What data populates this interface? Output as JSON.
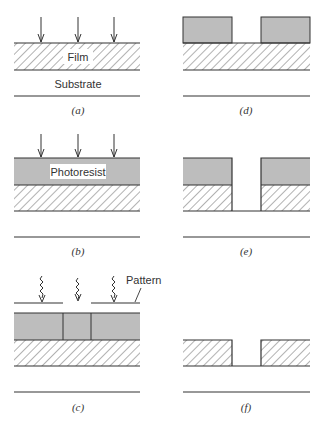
{
  "figure": {
    "colors": {
      "line": "#333333",
      "photoresist_fill": "#bdbdbd",
      "hatch": "#555555",
      "background": "#ffffff"
    },
    "panels": [
      {
        "id": "a",
        "caption": "(a)",
        "labels": {
          "film": "Film",
          "substrate": "Substrate"
        },
        "step": "Film deposition on substrate"
      },
      {
        "id": "b",
        "caption": "(b)",
        "labels": {
          "photoresist": "Photoresist"
        },
        "step": "Photoresist coating"
      },
      {
        "id": "c",
        "caption": "(c)",
        "labels": {
          "pattern": "Pattern"
        },
        "step": "Exposure through pattern mask"
      },
      {
        "id": "d",
        "caption": "(d)",
        "labels": {},
        "step": "Development of resist"
      },
      {
        "id": "e",
        "caption": "(e)",
        "labels": {},
        "step": "Film etching"
      },
      {
        "id": "f",
        "caption": "(f)",
        "labels": {},
        "step": "Resist removal"
      }
    ]
  }
}
